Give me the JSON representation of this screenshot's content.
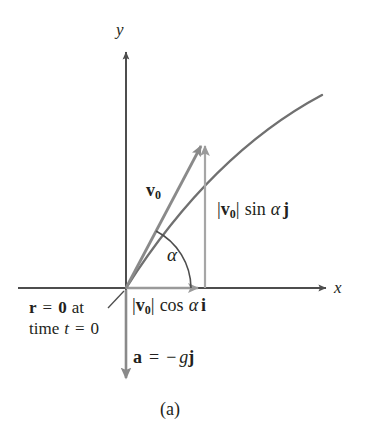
{
  "figure": {
    "caption": "(a)",
    "axes": {
      "y_label": "y",
      "x_label": "x"
    },
    "labels": {
      "velocity_vector": {
        "symbol": "v",
        "subscript": "0"
      },
      "vertical_component": {
        "bar_open": "|",
        "symbol": "v",
        "subscript": "0",
        "bar_close": "|",
        "trig": "sin",
        "angle": "α",
        "unit_vector": "j"
      },
      "horizontal_component": {
        "bar_open": "|",
        "symbol": "v",
        "subscript": "0",
        "bar_close": "|",
        "trig": "cos",
        "angle": "α",
        "unit_vector": "i"
      },
      "angle": "α",
      "acceleration": {
        "symbol": "a",
        "equals": "=",
        "minus": "−",
        "g": "g",
        "unit_vector": "j"
      },
      "initial_position": {
        "line1_r": "r",
        "line1_equals": "=",
        "line1_zero": "0",
        "line1_at": "at",
        "line2_time": "time",
        "line2_t": "t",
        "line2_equals": "=",
        "line2_zero": "0"
      }
    },
    "colors": {
      "axis": "#4d4d4d",
      "vector": "#8c8c8c",
      "trajectory": "#6e6e6e",
      "text": "#231f20",
      "background": "#ffffff"
    }
  }
}
